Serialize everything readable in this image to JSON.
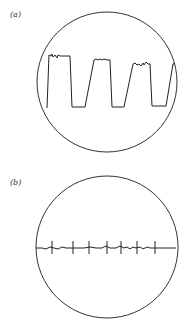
{
  "figure": {
    "panels": [
      {
        "label": "(a)",
        "description": "Oscilloscope screen showing a square-like wave with sloped rising edges and noisy plateaus",
        "circle": {
          "cx": 107,
          "cy": 82,
          "r": 70
        },
        "trace_points": "47,108 49,55 51,56 52,54 53,57 55,55 57,58 58,55 60,56 70,56 72,107 85,107 94,60 96,59 98,60 100,59 102,60 104,59 107,60 110,60 112,107 124,107 133,64 135,63 137,65 139,64 141,66 143,63 144,65 146,62 148,64 150,64 152,106 166,106 173,64 175,63"
      },
      {
        "label": "(b)",
        "description": "Oscilloscope screen showing a flat noisy baseline with periodic vertical spike markers",
        "circle": {
          "cx": 107,
          "cy": 247,
          "r": 71
        },
        "baseline_points": "36,248 42,248 46,249 50,247 54,248 58,249 62,247 66,248 72,248 78,248 84,248 90,247 96,248 102,248 106,246 110,248 116,248 120,246 124,248 127,247 130,249 133,247 136,248 140,247 143,249 147,247 150,248 156,248 162,248 168,248 176,248",
        "tick_x": [
          52,
          73,
          89,
          107,
          121,
          137,
          155
        ],
        "tick_top": 241,
        "tick_bottom": 254
      }
    ],
    "colors": {
      "stroke": "#222222",
      "circle": "#333333",
      "background": "#ffffff"
    }
  }
}
